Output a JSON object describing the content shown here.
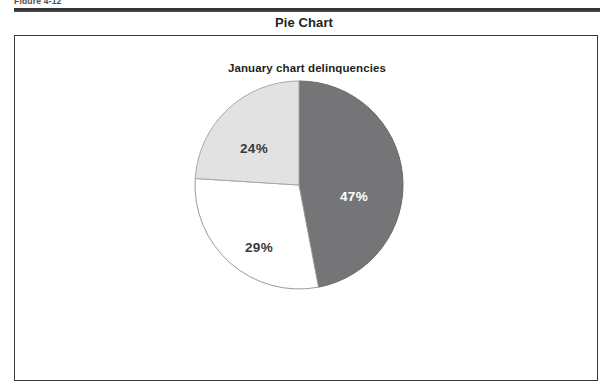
{
  "figure": {
    "caption": "Figure 4-12"
  },
  "section": {
    "title": "Pie Chart"
  },
  "chart_data": {
    "type": "pie",
    "title": "January chart delinquencies",
    "subtitle": "",
    "xlabel": "",
    "ylabel": "",
    "grid": false,
    "legend": "none",
    "start_angle_deg": 0,
    "direction": "clockwise",
    "categories": [
      "47%",
      "29%",
      "24%"
    ],
    "values": [
      47,
      29,
      24
    ],
    "slices": [
      {
        "label": "47%",
        "value": 47,
        "fill": "#757578",
        "stroke": "#6a6a6d",
        "label_color": "#ffffff",
        "start_deg": 0,
        "end_deg": 169.2,
        "label_x": 55,
        "label_y": 12
      },
      {
        "label": "29%",
        "value": 29,
        "fill": "#ffffff",
        "stroke": "#9a9a9c",
        "label_color": "#3a3a3c",
        "start_deg": 169.2,
        "end_deg": 273.6,
        "label_x": -40,
        "label_y": 63
      },
      {
        "label": "24%",
        "value": 24,
        "fill": "#e2e2e2",
        "stroke": "#a8a8aa",
        "label_color": "#3a3a3c",
        "start_deg": 273.6,
        "end_deg": 360,
        "label_x": -45,
        "label_y": -36
      }
    ],
    "geometry": {
      "center_x": 107,
      "center_y": 107,
      "radius": 104
    }
  },
  "colors": {
    "rule": "#2f2f31",
    "panel_border": "#3b3b3d",
    "text": "#231f20",
    "slice_dark": "#757578",
    "slice_light": "#e2e2e2",
    "slice_white": "#ffffff"
  }
}
